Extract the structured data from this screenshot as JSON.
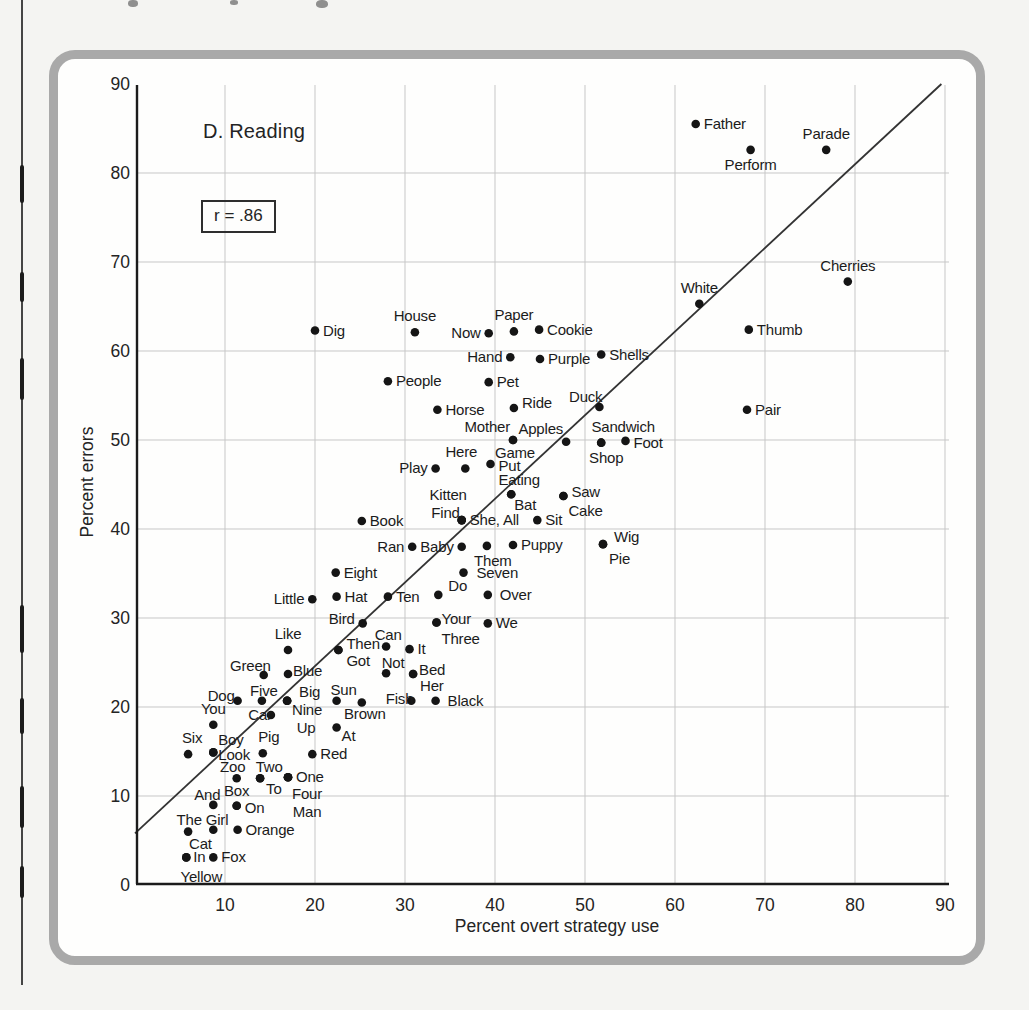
{
  "figure": {
    "panel_label": "D. Reading",
    "correlation_label": "r = .86"
  },
  "colors": {
    "page_background": "#f4f4f2",
    "panel_background": "#fefefd",
    "panel_border": "#a9a9a9",
    "grid": "#c7c7c7",
    "axis": "#1b1b1b",
    "regression_line": "#333333",
    "dot": "#151515",
    "text": "#1c1c1c"
  },
  "chart_data": {
    "type": "scatter",
    "title": "D. Reading",
    "annotation": "r = .86",
    "xlabel": "Percent overt strategy use",
    "ylabel": "Percent errors",
    "xlim": [
      0,
      91
    ],
    "ylim": [
      0,
      90
    ],
    "x_ticks": [
      10,
      20,
      30,
      40,
      50,
      60,
      70,
      80,
      90
    ],
    "y_ticks": [
      0,
      10,
      20,
      30,
      40,
      50,
      60,
      70,
      80,
      90
    ],
    "grid": true,
    "legend": "none",
    "regression_line": {
      "x1": 0,
      "y1": 5.8,
      "x2": 89.6,
      "y2": 90.0
    },
    "points": [
      {
        "label": "Father",
        "x": 62.3,
        "y": 85.5,
        "a": "r"
      },
      {
        "label": "Perform",
        "x": 68.4,
        "y": 82.6,
        "a": "b"
      },
      {
        "label": "Parade",
        "x": 76.8,
        "y": 82.6,
        "a": "a"
      },
      {
        "label": "Cherries",
        "x": 79.2,
        "y": 67.8,
        "a": "a"
      },
      {
        "label": "White",
        "x": 62.7,
        "y": 65.3,
        "a": "a"
      },
      {
        "label": "Thumb",
        "x": 68.2,
        "y": 62.4,
        "a": "r"
      },
      {
        "label": "Pair",
        "x": 68.0,
        "y": 53.4,
        "a": "r"
      },
      {
        "label": "Dig",
        "x": 20.0,
        "y": 62.3,
        "a": "r"
      },
      {
        "label": "House",
        "x": 31.1,
        "y": 62.1,
        "a": "a"
      },
      {
        "label": "Now",
        "x": 39.3,
        "y": 62.0,
        "a": "l"
      },
      {
        "label": "Paper",
        "x": 42.1,
        "y": 62.2,
        "a": "a"
      },
      {
        "label": "Cookie",
        "x": 44.9,
        "y": 62.4,
        "a": "r"
      },
      {
        "label": "Hand",
        "x": 41.7,
        "y": 59.3,
        "a": "l"
      },
      {
        "label": "Purple",
        "x": 45.0,
        "y": 59.1,
        "a": "r"
      },
      {
        "label": "Shells",
        "x": 51.8,
        "y": 59.6,
        "a": "r"
      },
      {
        "label": "People",
        "x": 28.1,
        "y": 56.6,
        "a": "r"
      },
      {
        "label": "Pet",
        "x": 39.3,
        "y": 56.5,
        "a": "r"
      },
      {
        "label": "Horse",
        "x": 33.6,
        "y": 53.4,
        "a": "r"
      },
      {
        "label": "Ride",
        "x": 42.1,
        "y": 53.6,
        "a": "r",
        "ny": -5
      },
      {
        "label": "Duck",
        "x": 51.6,
        "y": 53.7,
        "a": "al",
        "nx": 6,
        "ny": 3
      },
      {
        "label": "Mother",
        "x": 42.0,
        "y": 50.0,
        "a": "al"
      },
      {
        "label": "Game",
        "x": 42.0,
        "y": 50.0,
        "a": "b",
        "nx": 2,
        "ny": -2
      },
      {
        "label": "Apples",
        "x": 47.9,
        "y": 49.8,
        "a": "al"
      },
      {
        "label": "Sandwich",
        "x": 51.8,
        "y": 49.7,
        "a": "a",
        "nx": 22
      },
      {
        "label": "Shop",
        "x": 51.8,
        "y": 49.7,
        "a": "b",
        "nx": 5
      },
      {
        "label": "Foot",
        "x": 54.5,
        "y": 49.9,
        "a": "r",
        "ny": 2
      },
      {
        "label": "Put",
        "x": 39.5,
        "y": 47.3,
        "a": "r",
        "ny": 2
      },
      {
        "label": "Here",
        "x": 36.7,
        "y": 46.8,
        "a": "a",
        "nx": -4
      },
      {
        "label": "Play",
        "x": 33.4,
        "y": 46.8,
        "a": "l"
      },
      {
        "label": "Eating",
        "x": 41.8,
        "y": 43.9,
        "a": "a",
        "nx": 8,
        "ny": 2
      },
      {
        "label": "Bat",
        "x": 41.8,
        "y": 43.9,
        "a": "br",
        "ny": -2
      },
      {
        "label": "Saw",
        "x": 47.6,
        "y": 43.7,
        "a": "r",
        "ny": -4
      },
      {
        "label": "Cake",
        "x": 47.6,
        "y": 43.7,
        "a": "br",
        "nx": 2,
        "ny": 2
      },
      {
        "label": "Kitten",
        "x": 36.3,
        "y": 41.0,
        "a": "al",
        "nx": 8,
        "ny": -12
      },
      {
        "label": "Find",
        "x": 36.3,
        "y": 41.0,
        "a": "l",
        "nx": 6,
        "ny": -7
      },
      {
        "label": "She, All",
        "x": 36.3,
        "y": 41.0,
        "a": "r"
      },
      {
        "label": "Sit",
        "x": 44.7,
        "y": 41.0,
        "a": "r"
      },
      {
        "label": "Book",
        "x": 25.2,
        "y": 40.9,
        "a": "r"
      },
      {
        "label": "Ran",
        "x": 30.8,
        "y": 38.0,
        "a": "l"
      },
      {
        "label": "Baby",
        "x": 36.3,
        "y": 38.0,
        "a": "l"
      },
      {
        "label": "Them",
        "x": 39.1,
        "y": 38.1,
        "a": "b",
        "nx": 6
      },
      {
        "label": "Puppy",
        "x": 42.0,
        "y": 38.2,
        "a": "r"
      },
      {
        "label": "Wig",
        "x": 52.0,
        "y": 38.3,
        "a": "r",
        "nx": 3,
        "ny": -7
      },
      {
        "label": "Pie",
        "x": 52.0,
        "y": 38.3,
        "a": "br",
        "nx": 3,
        "ny": 2
      },
      {
        "label": "Seven",
        "x": 36.5,
        "y": 35.1,
        "a": "r",
        "nx": 5
      },
      {
        "label": "Do",
        "x": 33.7,
        "y": 32.6,
        "a": "ar",
        "nx": 7,
        "ny": 4
      },
      {
        "label": "Over",
        "x": 39.2,
        "y": 32.6,
        "a": "r",
        "nx": 4
      },
      {
        "label": "Eight",
        "x": 22.3,
        "y": 35.1,
        "a": "r"
      },
      {
        "label": "Little",
        "x": 19.7,
        "y": 32.1,
        "a": "l"
      },
      {
        "label": "Hat",
        "x": 22.4,
        "y": 32.4,
        "a": "r"
      },
      {
        "label": "Ten",
        "x": 28.1,
        "y": 32.4,
        "a": "r"
      },
      {
        "label": "Bird",
        "x": 25.3,
        "y": 29.4,
        "a": "l",
        "ny": -4
      },
      {
        "label": "Your",
        "x": 33.5,
        "y": 29.5,
        "a": "ar",
        "nx": 2,
        "ny": 10
      },
      {
        "label": "Three",
        "x": 33.5,
        "y": 29.5,
        "a": "br",
        "nx": 2,
        "ny": 4
      },
      {
        "label": "We",
        "x": 39.2,
        "y": 29.4,
        "a": "r"
      },
      {
        "label": "Like",
        "x": 17.0,
        "y": 26.4,
        "a": "a"
      },
      {
        "label": "Then",
        "x": 22.6,
        "y": 26.4,
        "a": "r",
        "ny": -6
      },
      {
        "label": "Got",
        "x": 22.6,
        "y": 26.4,
        "a": "br",
        "nx": 5,
        "ny": -2
      },
      {
        "label": "Can",
        "x": 27.9,
        "y": 26.8,
        "a": "a",
        "nx": 2,
        "ny": 5
      },
      {
        "label": "It",
        "x": 30.5,
        "y": 26.5,
        "a": "r"
      },
      {
        "label": "Not",
        "x": 27.9,
        "y": 23.8,
        "a": "a",
        "nx": 7,
        "ny": 6
      },
      {
        "label": "Bed",
        "x": 30.9,
        "y": 23.7,
        "a": "ar",
        "nx": 3,
        "ny": 9
      },
      {
        "label": "Her",
        "x": 30.9,
        "y": 23.7,
        "a": "br",
        "nx": 4,
        "ny": -1
      },
      {
        "label": "Green",
        "x": 14.3,
        "y": 23.6,
        "a": "al",
        "nx": 10,
        "ny": 4
      },
      {
        "label": "Blue",
        "x": 17.0,
        "y": 23.7,
        "a": "ar",
        "nx": 2,
        "ny": 10
      },
      {
        "label": "Fish",
        "x": 30.7,
        "y": 20.7,
        "a": "al",
        "nx": 5,
        "ny": 11
      },
      {
        "label": "Black",
        "x": 33.4,
        "y": 20.7,
        "a": "r",
        "nx": 4
      },
      {
        "label": "Sun",
        "x": 22.4,
        "y": 20.7,
        "a": "a",
        "nx": 7,
        "ny": 5
      },
      {
        "label": "Brown",
        "x": 25.2,
        "y": 20.5,
        "a": "b",
        "nx": 3,
        "ny": -4
      },
      {
        "label": "Big",
        "x": 16.9,
        "y": 20.7,
        "a": "ar",
        "nx": 9,
        "ny": 4
      },
      {
        "label": "Nine",
        "x": 16.9,
        "y": 20.7,
        "a": "br",
        "nx": 2,
        "ny": -4
      },
      {
        "label": "Up",
        "x": 16.9,
        "y": 20.7,
        "a": "b",
        "nx": 19,
        "ny": 12
      },
      {
        "label": "Five",
        "x": 14.1,
        "y": 20.7,
        "a": "a",
        "nx": 2,
        "ny": 6
      },
      {
        "label": "Dog",
        "x": 11.4,
        "y": 20.7,
        "a": "al",
        "ny": 8
      },
      {
        "label": "Car",
        "x": 15.1,
        "y": 19.1,
        "a": "l",
        "nx": 9
      },
      {
        "label": "You",
        "x": 8.7,
        "y": 18.0,
        "a": "a"
      },
      {
        "label": "At",
        "x": 22.4,
        "y": 17.7,
        "a": "br",
        "nx": 2,
        "ny": -4
      },
      {
        "label": "Six",
        "x": 5.9,
        "y": 14.7,
        "a": "a",
        "nx": 4
      },
      {
        "label": "Boy",
        "x": 8.7,
        "y": 14.9,
        "a": "ar",
        "nx": 2,
        "ny": 1
      },
      {
        "label": "Look",
        "x": 8.7,
        "y": 14.9,
        "a": "r",
        "nx": -3,
        "ny": 3
      },
      {
        "label": "Pig",
        "x": 14.2,
        "y": 14.8,
        "a": "a",
        "nx": 6
      },
      {
        "label": "Red",
        "x": 19.7,
        "y": 14.7,
        "a": "r"
      },
      {
        "label": "Zoo",
        "x": 11.3,
        "y": 12.0,
        "a": "a",
        "nx": -4,
        "ny": 5
      },
      {
        "label": "Two",
        "x": 13.9,
        "y": 12.0,
        "a": "a",
        "nx": 9,
        "ny": 5
      },
      {
        "label": "One",
        "x": 17.0,
        "y": 12.1,
        "a": "r"
      },
      {
        "label": "To",
        "x": 13.9,
        "y": 12.0,
        "a": "br",
        "nx": 3,
        "ny": -2
      },
      {
        "label": "Four",
        "x": 17.0,
        "y": 12.1,
        "a": "b",
        "nx": 19,
        "ny": 2
      },
      {
        "label": "Man",
        "x": 17.0,
        "y": 12.1,
        "a": "b",
        "nx": 19,
        "ny": 20
      },
      {
        "label": "And",
        "x": 8.7,
        "y": 9.0,
        "a": "al",
        "nx": 10,
        "ny": 3
      },
      {
        "label": "Box",
        "x": 11.3,
        "y": 8.9,
        "a": "a",
        "ny": 1
      },
      {
        "label": "On",
        "x": 11.3,
        "y": 8.9,
        "a": "r",
        "ny": 2
      },
      {
        "label": "Orange",
        "x": 11.4,
        "y": 6.2,
        "a": "r"
      },
      {
        "label": "The Girl",
        "x": 8.7,
        "y": 6.2,
        "a": "al",
        "nx": 18,
        "ny": 3
      },
      {
        "label": "Cat",
        "x": 5.9,
        "y": 6.0,
        "a": "br",
        "nx": -2,
        "ny": -1
      },
      {
        "label": "In",
        "x": 5.7,
        "y": 3.1,
        "a": "r",
        "nx": -1
      },
      {
        "label": "Fox",
        "x": 8.7,
        "y": 3.1,
        "a": "r"
      },
      {
        "label": "Yellow",
        "x": 5.7,
        "y": 3.1,
        "a": "b",
        "nx": 15,
        "ny": 5
      }
    ]
  }
}
